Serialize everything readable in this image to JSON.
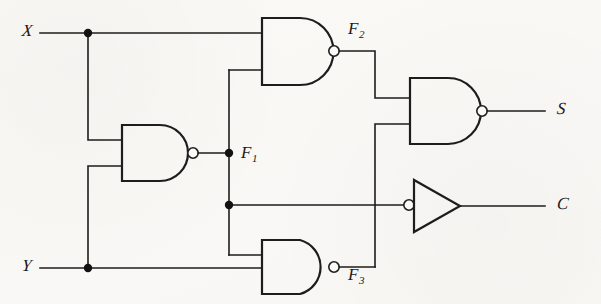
{
  "figure": {
    "kind": "logic-circuit-schematic",
    "background_color": "#fbfaf8",
    "ink_color": "#1d1d1d"
  },
  "inputs": [
    {
      "id": "X",
      "label": "X"
    },
    {
      "id": "Y",
      "label": "Y"
    }
  ],
  "outputs": [
    {
      "id": "S",
      "label": "S"
    },
    {
      "id": "C",
      "label": "C"
    }
  ],
  "nodes": [
    {
      "id": "F1",
      "label": "F",
      "subscript": "1"
    },
    {
      "id": "F2",
      "label": "F",
      "subscript": "2"
    },
    {
      "id": "F3",
      "label": "F",
      "subscript": "3"
    }
  ],
  "gates": [
    {
      "id": "G1",
      "type": "nand",
      "output_node": "F1",
      "inputs": [
        "X",
        "Y"
      ]
    },
    {
      "id": "G2",
      "type": "nand",
      "output_node": "F2",
      "inputs": [
        "X",
        "F1"
      ]
    },
    {
      "id": "G3",
      "type": "nand",
      "output_node": "F3",
      "inputs": [
        "F1",
        "Y"
      ]
    },
    {
      "id": "G4",
      "type": "nand",
      "output_node": "S",
      "inputs": [
        "F2",
        "F3"
      ]
    },
    {
      "id": "G5",
      "type": "inverter",
      "output_node": "C",
      "inputs": [
        "F1"
      ],
      "bubble_side": "input"
    }
  ],
  "junctions": [
    {
      "id": "J-X",
      "on": "X"
    },
    {
      "id": "J-Y",
      "on": "Y"
    },
    {
      "id": "J-F1-top",
      "on": "F1"
    },
    {
      "id": "J-F1-bottom",
      "on": "F1"
    }
  ]
}
